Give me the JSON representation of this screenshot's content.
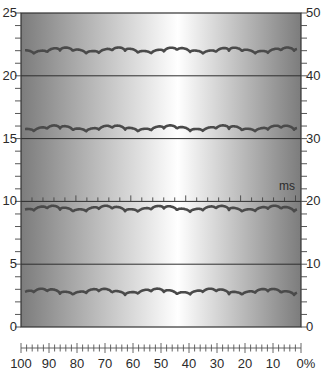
{
  "figure": {
    "plot_box": {
      "x": 21,
      "y": 13,
      "w": 280,
      "h": 314
    },
    "background_gradient": {
      "edge_color": "#7c7c7c",
      "center_color": "#ffffff",
      "center_x_fraction": 0.56
    },
    "trace_color": "#4a4a4a",
    "grid_line_color": "#2e2e2e",
    "left_axis": {
      "min": 0,
      "max": 25,
      "labels": [
        "0",
        "5",
        "10",
        "15",
        "20",
        "25"
      ],
      "major_step": 5,
      "minor_step": 1
    },
    "right_axis": {
      "min": 0,
      "max": 50,
      "labels": [
        "0",
        "10",
        "20",
        "30",
        "40",
        "50"
      ],
      "major_step": 10,
      "minor_step": 2
    },
    "horizontal_lines_left_values": [
      20,
      15,
      10,
      5
    ],
    "time_scale": {
      "unit_label": "ms",
      "on_left_value": 10,
      "tick_count": 25,
      "long_tick_every": 5
    },
    "traces": [
      {
        "name": "trace-1",
        "baseline_left_value": 22.0
      },
      {
        "name": "trace-2",
        "baseline_left_value": 15.8
      },
      {
        "name": "trace-3",
        "baseline_left_value": 9.4
      },
      {
        "name": "trace-4",
        "baseline_left_value": 2.8
      }
    ],
    "bottom_scale": {
      "labels": [
        "100",
        "90",
        "80",
        "70",
        "60",
        "50",
        "40",
        "30",
        "20",
        "10",
        "0%"
      ],
      "minor_per_major": 5
    }
  }
}
